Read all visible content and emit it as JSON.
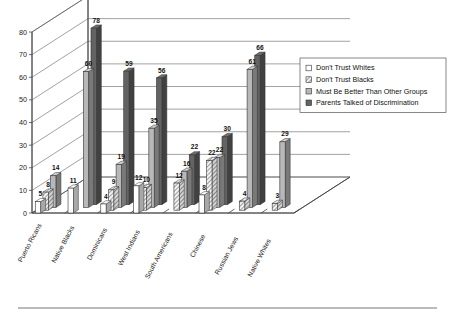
{
  "chart_data": {
    "type": "bar",
    "title": "",
    "xlabel": "",
    "ylabel": "",
    "ylim": [
      0,
      80
    ],
    "ytick_step": 10,
    "yticks": [
      "0",
      "10",
      "20",
      "30",
      "40",
      "50",
      "60",
      "70",
      "80"
    ],
    "grid": true,
    "three_d": true,
    "legend_position": "right",
    "categories": [
      "Puerto Ricans",
      "Native Blacks",
      "Dominicans",
      "West Indians",
      "South Americans",
      "Chinese",
      "Russian Jews",
      "Native Whites"
    ],
    "series": [
      {
        "name": "Don't Trust Whites",
        "swatch": "#ffffff",
        "pattern": "solid-white",
        "values": [
          5,
          11,
          4,
          12,
          null,
          8,
          null,
          null
        ]
      },
      {
        "name": "Don't Trust Blacks",
        "swatch": "#e8e8e8",
        "pattern": "diagonal-hatch",
        "values": [
          8,
          null,
          9,
          10,
          12,
          22,
          4,
          3
        ]
      },
      {
        "name": "Must Be Better Than Other Groups",
        "swatch": "#b8b8b8",
        "pattern": "solid-light-gray",
        "values": [
          14,
          60,
          19,
          35,
          16,
          22,
          61,
          29
        ]
      },
      {
        "name": "Parents Talked of Discrimination",
        "swatch": "#636363",
        "pattern": "solid-dark-gray",
        "values": [
          null,
          78,
          59,
          56,
          22,
          30,
          66,
          null
        ]
      }
    ],
    "extra_labels": [
      {
        "text": "3",
        "category": "South Americans",
        "series": "Don't Trust Whites",
        "note": "small white bar value"
      },
      {
        "text": "61",
        "category": "Russian Jews",
        "series": "Must Be Better Than Other Groups",
        "note": "duplicate label near overlapping bars"
      }
    ]
  },
  "legend": {
    "items": [
      {
        "label": "Don't Trust Whites",
        "swatch": "#ffffff"
      },
      {
        "label": "Don't Trust Blacks",
        "swatch": "#e8e8e8"
      },
      {
        "label": "Must Be Better Than Other Groups",
        "swatch": "#b8b8b8"
      },
      {
        "label": "Parents Talked of Discrimination",
        "swatch": "#636363"
      }
    ]
  },
  "colors": {
    "series_1": "#ffffff",
    "series_2": "#e8e8e8",
    "series_3": "#b8b8b8",
    "series_4": "#636363",
    "axis": "#444444",
    "grid": "#555555",
    "background": "#ffffff"
  }
}
